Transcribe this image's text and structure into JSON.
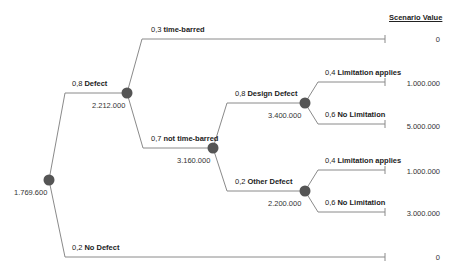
{
  "header": {
    "scenario_value_label": "Scenario Value"
  },
  "colors": {
    "node": "#555555",
    "edge": "#8a8a8a",
    "text": "#222222"
  },
  "nodes": {
    "root": {
      "expected_value": "1.769.600",
      "icon": "chance-node-circle"
    },
    "defect": {
      "expected_value": "2.212.000",
      "icon": "chance-node-circle"
    },
    "not_time_barred": {
      "expected_value": "3.160.000",
      "icon": "chance-node-circle"
    },
    "design_defect": {
      "expected_value": "3.400.000",
      "icon": "chance-node-circle"
    },
    "other_defect": {
      "expected_value": "2.200.000",
      "icon": "chance-node-circle"
    }
  },
  "branches": {
    "defect": {
      "prob": "0,8",
      "name": "Defect"
    },
    "no_defect": {
      "prob": "0,2",
      "name": "No Defect"
    },
    "time_barred": {
      "prob": "0,3",
      "name": "time-barred"
    },
    "not_time_barred": {
      "prob": "0,7",
      "name": "not time-barred"
    },
    "design_defect": {
      "prob": "0,8",
      "name": "Design Defect"
    },
    "other_defect": {
      "prob": "0,2",
      "name": "Other Defect"
    },
    "design_limitation_applies": {
      "prob": "0,4",
      "name": "Limitation applies"
    },
    "design_no_limitation": {
      "prob": "0,6",
      "name": "No Limitation"
    },
    "other_limitation_applies": {
      "prob": "0,4",
      "name": "Limitation applies"
    },
    "other_no_limitation": {
      "prob": "0,6",
      "name": "No Limitation"
    }
  },
  "terminals": {
    "time_barred": "0",
    "design_limitation_applies": "1.000.000",
    "design_no_limitation": "5.000.000",
    "other_limitation_applies": "1.000.000",
    "other_no_limitation": "3.000.000",
    "no_defect": "0"
  }
}
